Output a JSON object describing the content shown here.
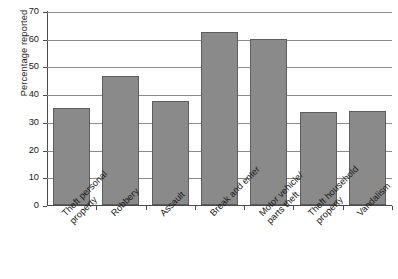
{
  "chart_data": {
    "type": "bar",
    "title": "",
    "xlabel": "",
    "ylabel": "Percentage reported",
    "ylim": [
      0,
      70
    ],
    "ytick_step": 10,
    "yticks": [
      0,
      10,
      20,
      30,
      40,
      50,
      60,
      70
    ],
    "grid": "horizontal",
    "legend": "none",
    "bar_color": "#8a8a8a",
    "bar_border_color": "#5d5d5d",
    "gridline_color": "#8c8c8c",
    "axis_color": "#4a4a4a",
    "categories": [
      "Theft personal property",
      "Robbery",
      "Assault",
      "Break and enter",
      "Motor vehicle/ parts theft",
      "Theft household property",
      "Vandalism"
    ],
    "category_lines": [
      [
        "Theft personal",
        "property"
      ],
      [
        "Robbery"
      ],
      [
        "Assault"
      ],
      [
        "Break and enter"
      ],
      [
        "Motor vehicle/",
        "parts theft"
      ],
      [
        "Theft household",
        "property"
      ],
      [
        "Vandalism"
      ]
    ],
    "values": [
      35,
      46.5,
      37.5,
      62.5,
      60,
      33.5,
      34
    ]
  }
}
